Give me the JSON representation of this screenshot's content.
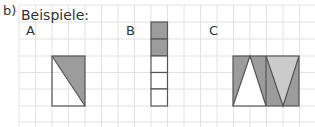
{
  "task_label": "b)",
  "heading": "Beispiele:",
  "examples": [
    {
      "label": "A",
      "description": "1x3 rectangle split diagonally, upper-right triangle shaded"
    },
    {
      "label": "B",
      "description": "1x5 column of squares, top 2 shaded"
    },
    {
      "label": "C",
      "description": "4x3 rectangle with triangles, partially shaded in two grey tones"
    }
  ],
  "colors": {
    "grid": "#e0e0e0",
    "outline": "#555555",
    "dark_shade": "#9a9a9a",
    "light_shade": "#c8c8c8"
  }
}
